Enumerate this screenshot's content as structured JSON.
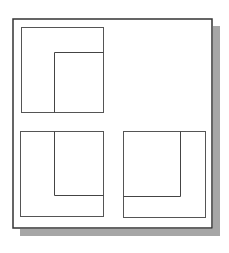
{
  "diagram": {
    "type": "orthographic-projection",
    "colors": {
      "background": "#ffffff",
      "frame_stroke": "#333333",
      "shadow": "#a6a6a6",
      "view_stroke": "#555555",
      "hidden_edge_stroke": "#444444"
    },
    "frame": {
      "x": 13,
      "y": 19,
      "width": 199,
      "height": 209,
      "stroke_width": 1.5
    },
    "shadow": {
      "offset_x": 7,
      "offset_y": 7
    },
    "views": [
      {
        "name": "top-view",
        "outer": {
          "x": 21,
          "y": 27,
          "width": 82,
          "height": 85
        },
        "inner_lines": [
          {
            "x1": 54,
            "y1": 52,
            "x2": 103,
            "y2": 52
          },
          {
            "x1": 54,
            "y1": 52,
            "x2": 54,
            "y2": 112
          }
        ]
      },
      {
        "name": "front-view",
        "outer": {
          "x": 20,
          "y": 131,
          "width": 83,
          "height": 85
        },
        "inner_lines": [
          {
            "x1": 54,
            "y1": 131,
            "x2": 54,
            "y2": 195
          },
          {
            "x1": 54,
            "y1": 195,
            "x2": 103,
            "y2": 195
          }
        ]
      },
      {
        "name": "side-view",
        "outer": {
          "x": 123,
          "y": 131,
          "width": 82,
          "height": 86
        },
        "inner_lines": [
          {
            "x1": 180,
            "y1": 131,
            "x2": 180,
            "y2": 196
          },
          {
            "x1": 123,
            "y1": 196,
            "x2": 180,
            "y2": 196
          }
        ]
      }
    ]
  }
}
